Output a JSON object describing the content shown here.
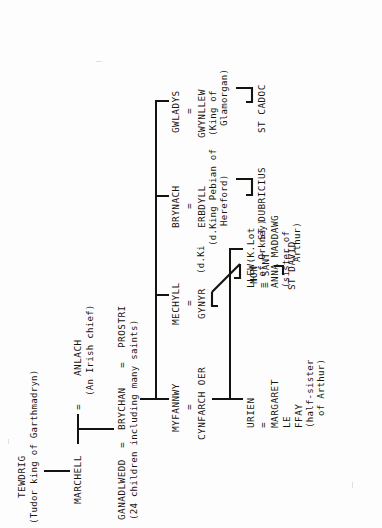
{
  "document": {
    "type": "genealogy-chart",
    "title": "Descent of Brychan of Garthmadryn",
    "orientation": "rotated-90-ccw"
  },
  "generations": {
    "g1": {
      "person": "TEWDRIG",
      "epithet": "(Tudor king of Garthmadryn)"
    },
    "g2": {
      "child": "MARCHELL",
      "equals": "=",
      "spouse": "ANLACH",
      "spouse_epithet": "(An Irish chief)"
    },
    "g3": {
      "spouse_left": "GANADLWEDD",
      "equals_left": "=",
      "person": "BRYCHAN",
      "equals_right": "=",
      "spouse_right": "PROSTRI",
      "note": "(24 children including many saints)"
    }
  },
  "children": [
    {
      "id": "gwladys",
      "name": "GWLADYS",
      "equals": "=",
      "spouse": "GWYNLLEW",
      "spouse_note_1": "(King of",
      "spouse_note_2": "Glamorgan)",
      "issue": "ST CADOC"
    },
    {
      "id": "brynach",
      "name": "BRYNACH",
      "equals": "=",
      "spouse": "ERBDYLL",
      "spouse_note_1": "(d.King Pebian of",
      "spouse_note_2": "Hereford)",
      "issue": "ST DUBRICIUS"
    },
    {
      "id": "mechyll",
      "name": "MECHYLL",
      "equals": "=",
      "spouse": "GYNYR",
      "issue_name": "NON",
      "issue_equals": "= SANT",
      "issue_child": "ST DAVID"
    },
    {
      "id": "myfannwy",
      "name": "MYFANNWY",
      "equals": "=",
      "spouse": "CYNFARCH OER"
    }
  ],
  "myfannwy_issue": [
    {
      "id": "llew",
      "name": "LLEW(K.Lot",
      "line_2": "= of Orkney)",
      "line_3": "ANNA MADDAWG",
      "line_4": "(sister of",
      "line_5": "Arthur)"
    },
    {
      "id": "urien",
      "name": "URIEN",
      "line_2": "=",
      "line_3": "MARGARET",
      "line_4": "LE",
      "line_5": "FFAY",
      "line_6": "(half-sister",
      "line_7": "of Arthur)"
    }
  ],
  "colors": {
    "ink": "#15140f",
    "paper": "#fdfdfd"
  }
}
